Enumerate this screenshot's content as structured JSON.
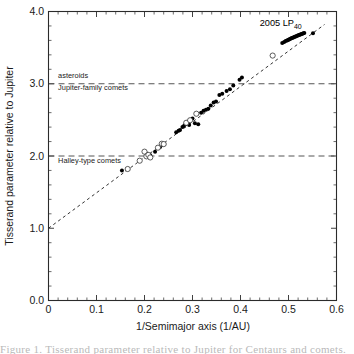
{
  "chart_data": {
    "type": "scatter",
    "title": "",
    "xlabel": "1/Semimajor axis (1/AU)",
    "ylabel": "Tisserand parameter relative to Jupiter",
    "xlim": [
      0,
      0.6
    ],
    "ylim": [
      0,
      4.0
    ],
    "xticks": [
      "0",
      "0.1",
      "0.2",
      "0.3",
      "0.4",
      "0.5",
      "0.6"
    ],
    "xtick_values": [
      0,
      0.1,
      0.2,
      0.3,
      0.4,
      0.5,
      0.6
    ],
    "yticks": [
      "0.0",
      "1.0",
      "2.0",
      "3.0",
      "4.0"
    ],
    "ytick_values": [
      0,
      1,
      2,
      3,
      4
    ],
    "x_minor_step": 0.02,
    "y_minor_step": 0.2,
    "grid": false,
    "legend": "none",
    "ticks_direction": "in",
    "frame": "box",
    "reference_lines": [
      {
        "name": "tisserand-3",
        "axis": "y",
        "value": 3.0,
        "style": "dashed"
      },
      {
        "name": "tisserand-2",
        "axis": "y",
        "value": 2.0,
        "style": "dashed"
      }
    ],
    "annotations": [
      {
        "name": "asteroids",
        "text": "asteroids",
        "x": 0.02,
        "y": 3.08,
        "align": "left"
      },
      {
        "name": "jupiter-family-comets",
        "text": "Jupiter-family comets",
        "x": 0.02,
        "y": 2.92,
        "align": "left"
      },
      {
        "name": "halley-type-comets",
        "text": "Halley-type comets",
        "x": 0.02,
        "y": 1.9,
        "align": "left"
      },
      {
        "name": "object-2005-lp40",
        "text": "2005 LP",
        "subscript": "40",
        "x": 0.44,
        "y": 3.8,
        "align": "left"
      }
    ],
    "trend_line": {
      "name": "fit-line",
      "style": "dashed",
      "x": [
        0.0,
        0.575
      ],
      "y": [
        1.0,
        3.82
      ]
    },
    "series": [
      {
        "name": "filled-points",
        "marker": "filled-circle",
        "points": [
          [
            0.153,
            1.8
          ],
          [
            0.206,
            2.03
          ],
          [
            0.212,
            2.01
          ],
          [
            0.222,
            2.06
          ],
          [
            0.232,
            2.12
          ],
          [
            0.236,
            2.15
          ],
          [
            0.241,
            2.165
          ],
          [
            0.266,
            2.33
          ],
          [
            0.271,
            2.35
          ],
          [
            0.274,
            2.36
          ],
          [
            0.279,
            2.4
          ],
          [
            0.282,
            2.415
          ],
          [
            0.285,
            2.44
          ],
          [
            0.288,
            2.455
          ],
          [
            0.29,
            2.47
          ],
          [
            0.293,
            2.43
          ],
          [
            0.296,
            2.5
          ],
          [
            0.3,
            2.52
          ],
          [
            0.305,
            2.455
          ],
          [
            0.312,
            2.44
          ],
          [
            0.318,
            2.6
          ],
          [
            0.323,
            2.625
          ],
          [
            0.328,
            2.64
          ],
          [
            0.333,
            2.655
          ],
          [
            0.338,
            2.7
          ],
          [
            0.344,
            2.74
          ],
          [
            0.349,
            2.755
          ],
          [
            0.356,
            2.845
          ],
          [
            0.362,
            2.86
          ],
          [
            0.371,
            2.9
          ],
          [
            0.378,
            2.925
          ],
          [
            0.385,
            2.975
          ],
          [
            0.398,
            3.055
          ],
          [
            0.403,
            3.085
          ],
          [
            0.487,
            3.565
          ],
          [
            0.491,
            3.578
          ],
          [
            0.494,
            3.59
          ],
          [
            0.497,
            3.6
          ],
          [
            0.499,
            3.605
          ],
          [
            0.501,
            3.612
          ],
          [
            0.503,
            3.62
          ],
          [
            0.505,
            3.625
          ],
          [
            0.507,
            3.632
          ],
          [
            0.509,
            3.638
          ],
          [
            0.511,
            3.645
          ],
          [
            0.513,
            3.65
          ],
          [
            0.515,
            3.655
          ],
          [
            0.517,
            3.662
          ],
          [
            0.519,
            3.668
          ],
          [
            0.521,
            3.672
          ],
          [
            0.523,
            3.678
          ],
          [
            0.525,
            3.682
          ],
          [
            0.527,
            3.688
          ],
          [
            0.529,
            3.692
          ],
          [
            0.531,
            3.698
          ],
          [
            0.533,
            3.702
          ],
          [
            0.551,
            3.7
          ]
        ]
      },
      {
        "name": "open-points",
        "marker": "open-circle",
        "points": [
          [
            0.165,
            1.82
          ],
          [
            0.19,
            1.935
          ],
          [
            0.2,
            2.06
          ],
          [
            0.204,
            1.995
          ],
          [
            0.208,
            2.015
          ],
          [
            0.212,
            1.98
          ],
          [
            0.228,
            2.115
          ],
          [
            0.236,
            2.17
          ],
          [
            0.24,
            2.165
          ],
          [
            0.287,
            2.46
          ],
          [
            0.295,
            2.495
          ],
          [
            0.308,
            2.585
          ],
          [
            0.467,
            3.39
          ]
        ]
      }
    ]
  },
  "caption": {
    "text": "Figure 1. Tisserand parameter relative to Jupiter for Centaurs and comets."
  }
}
